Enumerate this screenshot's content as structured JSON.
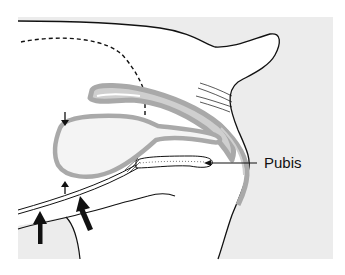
{
  "diagram": {
    "type": "anatomical-illustration",
    "labels": [
      {
        "id": "pubis",
        "text": "Pubis"
      }
    ],
    "colors": {
      "background_tissue": "#ececec",
      "organ_wall": "#a9a9a9",
      "organ_wall_light": "#cfcfcf",
      "outline": "#111111",
      "body_fill": "#ffffff"
    },
    "arrows": [
      {
        "id": "small-arrow-top",
        "direction": "down",
        "size": "small"
      },
      {
        "id": "small-arrow-bottom",
        "direction": "up",
        "size": "small"
      },
      {
        "id": "large-arrow-left",
        "direction": "up",
        "size": "large"
      },
      {
        "id": "large-arrow-right",
        "direction": "up-left",
        "size": "large"
      },
      {
        "id": "pubis-pointer",
        "direction": "left",
        "size": "leader-line"
      }
    ]
  }
}
